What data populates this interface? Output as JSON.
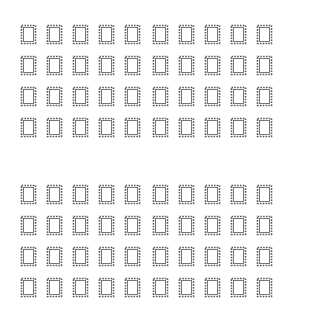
{
  "page": {
    "background": "#ffffff",
    "glyph_color": "#5a5a5a"
  },
  "blocks": [
    {
      "name": "top-block",
      "rows": [
        {
          "words": [
            [
              "?",
              "?",
              "?",
              "?",
              "?"
            ],
            [
              "?",
              "?",
              "?",
              "?",
              "?"
            ]
          ]
        },
        {
          "words": [
            [
              "?",
              "?",
              "?",
              "?",
              "?"
            ],
            [
              "?",
              "?",
              "?",
              "?",
              "?"
            ]
          ]
        },
        {
          "words": [
            [
              "?",
              "?",
              "?",
              "?",
              "?"
            ],
            [
              "?",
              "?",
              "?",
              "?",
              "?"
            ]
          ]
        },
        {
          "words": [
            [
              "?",
              "?",
              "?",
              "?",
              "?"
            ],
            [
              "?",
              "?",
              "?",
              "?",
              "?"
            ]
          ]
        }
      ]
    },
    {
      "name": "bottom-block",
      "rows": [
        {
          "words": [
            [
              "?",
              "?",
              "?",
              "?",
              "?"
            ],
            [
              "?",
              "?",
              "?",
              "?",
              "?"
            ]
          ]
        },
        {
          "words": [
            [
              "?",
              "?",
              "?",
              "?",
              "?"
            ],
            [
              "?",
              "?",
              "?",
              "?",
              "?"
            ]
          ]
        },
        {
          "words": [
            [
              "?",
              "?",
              "?",
              "?",
              "?"
            ],
            [
              "?",
              "?",
              "?",
              "?",
              "?"
            ]
          ]
        },
        {
          "words": [
            [
              "?",
              "?",
              "?",
              "?",
              "?"
            ],
            [
              "?",
              "?",
              "?",
              "?",
              "?"
            ]
          ]
        }
      ]
    }
  ]
}
